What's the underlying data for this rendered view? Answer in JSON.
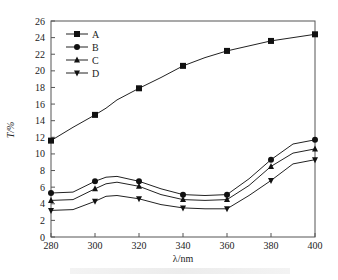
{
  "chart_data": {
    "type": "line",
    "title": "",
    "xlabel": "λ/nm",
    "ylabel": "T/%",
    "xlim": [
      280,
      400
    ],
    "ylim": [
      0,
      26
    ],
    "xticks": [
      280,
      300,
      320,
      340,
      360,
      380,
      400
    ],
    "yticks": [
      0,
      2,
      4,
      6,
      8,
      10,
      12,
      14,
      16,
      18,
      20,
      22,
      24,
      26
    ],
    "grid": false,
    "legend_position": "upper-left",
    "x": [
      280,
      290,
      300,
      305,
      310,
      320,
      330,
      340,
      350,
      360,
      370,
      380,
      390,
      400
    ],
    "series": [
      {
        "name": "A",
        "marker": "square",
        "values": [
          11.6,
          13.2,
          14.7,
          15.5,
          16.5,
          17.9,
          19.2,
          20.6,
          21.6,
          22.4,
          23.0,
          23.6,
          24.0,
          24.4
        ]
      },
      {
        "name": "B",
        "marker": "circle",
        "values": [
          5.3,
          5.4,
          6.7,
          7.2,
          7.3,
          6.7,
          5.8,
          5.1,
          5.0,
          5.1,
          7.0,
          9.3,
          11.2,
          11.7
        ]
      },
      {
        "name": "C",
        "marker": "triangle-up",
        "values": [
          4.4,
          4.5,
          5.8,
          6.4,
          6.6,
          6.1,
          5.1,
          4.5,
          4.4,
          4.5,
          6.2,
          8.5,
          10.1,
          10.6
        ]
      },
      {
        "name": "D",
        "marker": "triangle-down",
        "values": [
          3.2,
          3.3,
          4.3,
          4.9,
          5.0,
          4.6,
          3.9,
          3.5,
          3.4,
          3.4,
          5.0,
          6.8,
          8.8,
          9.3
        ]
      }
    ]
  },
  "caption": ""
}
